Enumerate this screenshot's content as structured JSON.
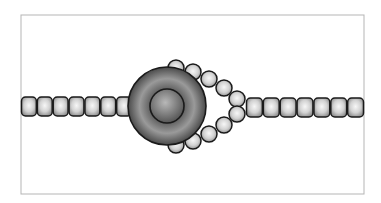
{
  "diagram": {
    "title": "",
    "frame": {
      "x": 21,
      "y": 15,
      "width": 343,
      "height": 179,
      "stroke": "#b5b5b5"
    },
    "colors": {
      "background": "#ffffff",
      "bead_light": "#f4f4f4",
      "bead_dark": "#8a8a8a",
      "outline": "#1a1a1a",
      "ring_light": "#9a9a9a",
      "ring_dark": "#4a4a4a",
      "core_light": "#b0b0b0",
      "core_dark": "#5a5a5a"
    },
    "left_chain": {
      "start_x": 21,
      "end_x": 132,
      "y": 97,
      "bead_w": 17,
      "bead_h": 19,
      "count": 7
    },
    "right_chain": {
      "start_x": 246,
      "end_x": 364,
      "y": 98,
      "bead_w": 17,
      "bead_h": 19,
      "count": 7
    },
    "ring": {
      "cx": 167,
      "cy": 106,
      "outer_r": 39,
      "inner_r": 17
    },
    "loop_beads": [
      {
        "cx": 176,
        "cy": 68
      },
      {
        "cx": 193,
        "cy": 72
      },
      {
        "cx": 209,
        "cy": 79
      },
      {
        "cx": 224,
        "cy": 88
      },
      {
        "cx": 237,
        "cy": 99
      },
      {
        "cx": 237,
        "cy": 114
      },
      {
        "cx": 224,
        "cy": 125
      },
      {
        "cx": 209,
        "cy": 134
      },
      {
        "cx": 193,
        "cy": 141
      },
      {
        "cx": 176,
        "cy": 145
      }
    ],
    "loop_bead_r": 8
  }
}
